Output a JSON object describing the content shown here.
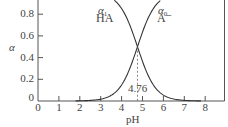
{
  "chart_data": {
    "type": "line",
    "title": "",
    "xlabel": "pH",
    "ylabel": "α",
    "xlim": [
      0,
      9
    ],
    "ylim": [
      0,
      1.0
    ],
    "x_ticks": [
      "0",
      "1",
      "2",
      "3",
      "4",
      "5",
      "6",
      "7",
      "8"
    ],
    "y_ticks": [
      "0",
      "0.2",
      "0.4",
      "0.6",
      "0.8"
    ],
    "grid": false,
    "legend": "inline labels",
    "pKa": 4.76,
    "annotation": {
      "text": "4.76",
      "x": 4.76,
      "y": 0.5,
      "style": "dashed vertical line from crossover to x-axis"
    },
    "series": [
      {
        "name": "α1 HA",
        "greek": "α",
        "subscript": "1",
        "species": "HA",
        "x": [
          2.0,
          2.5,
          3.0,
          3.5,
          4.0,
          4.5,
          4.76,
          5.0,
          5.5,
          6.0,
          6.5,
          7.0,
          7.5
        ],
        "values": [
          0.998,
          0.995,
          0.983,
          0.948,
          0.852,
          0.646,
          0.5,
          0.365,
          0.154,
          0.054,
          0.018,
          0.006,
          0.002
        ]
      },
      {
        "name": "α0 A−",
        "greek": "α",
        "subscript": "0",
        "species": "A⁻",
        "x": [
          2.0,
          2.5,
          3.0,
          3.5,
          4.0,
          4.5,
          4.76,
          5.0,
          5.5,
          6.0,
          6.5,
          7.0,
          7.5
        ],
        "values": [
          0.002,
          0.005,
          0.017,
          0.052,
          0.148,
          0.354,
          0.5,
          0.635,
          0.846,
          0.946,
          0.982,
          0.994,
          0.998
        ]
      }
    ]
  },
  "labels": {
    "y_axis": "α",
    "x_axis": "pH",
    "crossover": "4.76",
    "ha_greek": "α",
    "ha_sub": "1",
    "ha_species": "HA",
    "a_greek": "α",
    "a_sub": "0",
    "a_species": "A⁻"
  }
}
